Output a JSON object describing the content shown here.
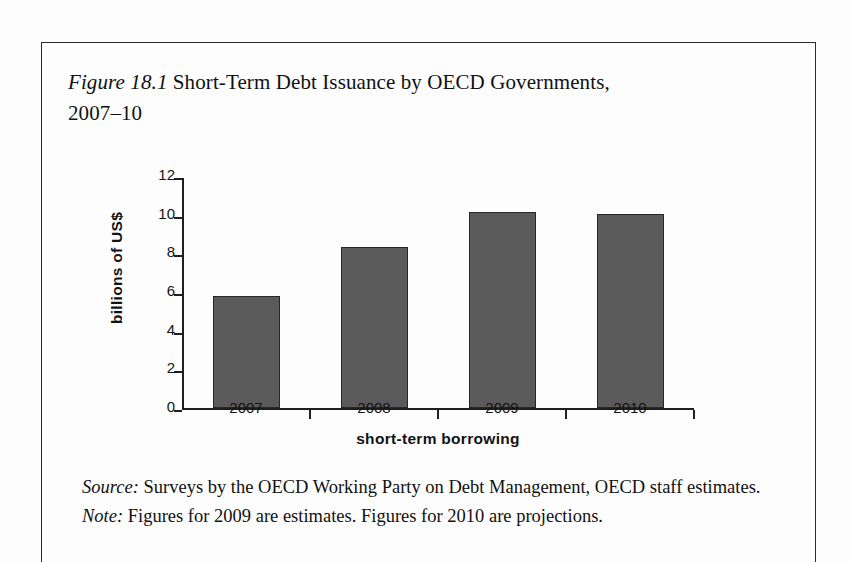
{
  "figure": {
    "label": "Figure 18.1",
    "title": " Short-Term Debt Issuance by OECD Governments, 2007–10",
    "source_label": "Source:",
    "source_text": " Surveys by the OECD Working Party on Debt Management, OECD staff estimates.",
    "note_label": "Note:",
    "note_text": " Figures for 2009 are estimates. Figures for 2010 are projections."
  },
  "chart_data": {
    "type": "bar",
    "title": "Short-Term Debt Issuance by OECD Governments, 2007–10",
    "categories": [
      "2007",
      "2008",
      "2009",
      "2010"
    ],
    "values": [
      5.8,
      8.35,
      10.15,
      10.05
    ],
    "xlabel": "short-term borrowing",
    "ylabel": "billions of US$",
    "ylim": [
      0,
      12
    ],
    "ytick_values": [
      0,
      2,
      4,
      6,
      8,
      10,
      12
    ],
    "ytick_labels": [
      "0",
      "2",
      "4",
      "6",
      "8",
      "10",
      "12"
    ],
    "grid": false,
    "legend": false,
    "bar_color": "#5a5a5a",
    "bar_edge_color": "#272727",
    "axis_color": "#1f1f1f",
    "background": "#fdfdfd"
  }
}
